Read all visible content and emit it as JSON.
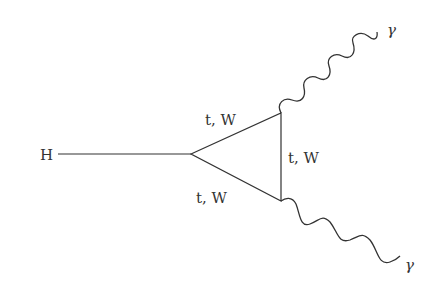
{
  "diagram": {
    "type": "feynman",
    "labels": {
      "higgs": "H",
      "loop_upper": "t, W",
      "loop_lower": "t, W",
      "loop_right": "t, W",
      "photon_upper": "γ",
      "photon_lower": "γ"
    },
    "colors": {
      "line": "#333333",
      "background": "#ffffff"
    }
  }
}
